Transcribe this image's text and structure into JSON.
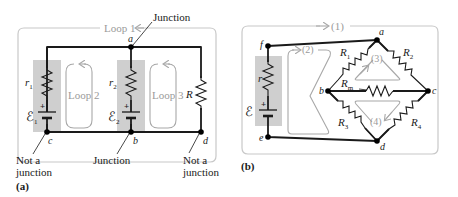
{
  "panel_a": {
    "caption": "(a)",
    "loop1_label": "Loop 1",
    "loop2_label": "Loop 2",
    "loop3_label": "Loop 3",
    "node_a": "a",
    "node_b": "b",
    "node_c": "c",
    "node_d": "d",
    "r1": "r",
    "r1_sub": "1",
    "emf1": "ℰ",
    "emf1_sub": "1",
    "r2": "r",
    "r2_sub": "2",
    "emf2": "ℰ",
    "emf2_sub": "2",
    "R": "R",
    "plus1": "+",
    "plus2": "+",
    "annotation_top": "Junction",
    "annotation_b": "Junction",
    "annotation_c_line1": "Not a",
    "annotation_c_line2": "junction",
    "annotation_d_line1": "Not a",
    "annotation_d_line2": "junction"
  },
  "panel_b": {
    "caption": "(b)",
    "loop1_label": "(1)",
    "loop2_label": "(2)",
    "loop3_label": "(3)",
    "loop4_label": "(4)",
    "node_a": "a",
    "node_b": "b",
    "node_c": "c",
    "node_d": "d",
    "node_e": "e",
    "node_f": "f",
    "r": "r",
    "emf": "ℰ",
    "plus": "+",
    "R1": "R",
    "R1_sub": "1",
    "R2": "R",
    "R2_sub": "2",
    "R3": "R",
    "R3_sub": "3",
    "R4": "R",
    "R4_sub": "4",
    "Rm": "R",
    "Rm_sub": "m"
  },
  "colors": {
    "wire": "#1a1a1a",
    "frame": "#c8c8c8",
    "loop_arrow": "#a8a8a8",
    "battery_shade": "#cfcfcf"
  }
}
